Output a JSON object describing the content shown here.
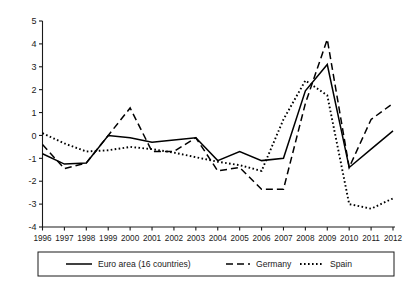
{
  "chart_data": {
    "type": "line",
    "title": "",
    "subtitle": "",
    "xlabel": "",
    "ylabel": "",
    "x": [
      1996,
      1997,
      1998,
      1999,
      2000,
      2001,
      2002,
      2003,
      2004,
      2005,
      2006,
      2007,
      2008,
      2009,
      2010,
      2011,
      2012
    ],
    "categories": [
      "1996",
      "1997",
      "1998",
      "1999",
      "2000",
      "2001",
      "2002",
      "2003",
      "2004",
      "2005",
      "2006",
      "2007",
      "2008",
      "2009",
      "2010",
      "2011",
      "2012"
    ],
    "xlim": [
      1996,
      2012
    ],
    "ylim": [
      -4,
      5
    ],
    "yticks": [
      5,
      4,
      3,
      2,
      1,
      0,
      -1,
      -2,
      -3,
      -4
    ],
    "ytick_labels": [
      "5",
      "4",
      "3",
      "2",
      "1",
      "0",
      "-1",
      "-2",
      "-3",
      "-4"
    ],
    "grid": false,
    "legend_position": "bottom",
    "series": [
      {
        "name": "Euro area (16 countries)",
        "style": "solid",
        "color": "#000000",
        "values": [
          -0.8,
          -1.25,
          -1.2,
          0.0,
          -0.1,
          -0.3,
          -0.2,
          -0.1,
          -1.1,
          -0.7,
          -1.1,
          -1.0,
          1.95,
          3.1,
          -1.4,
          -0.6,
          0.2
        ]
      },
      {
        "name": "Germany",
        "style": "dashed",
        "color": "#000000",
        "values": [
          -0.4,
          -1.45,
          -1.2,
          0.0,
          1.2,
          -0.7,
          -0.7,
          -0.1,
          -1.55,
          -1.4,
          -2.35,
          -2.35,
          1.4,
          4.2,
          -1.4,
          0.7,
          1.4
        ]
      },
      {
        "name": "Spain",
        "style": "dotted",
        "color": "#000000",
        "values": [
          0.1,
          -0.35,
          -0.7,
          -0.65,
          -0.5,
          -0.6,
          -0.75,
          -0.95,
          -1.15,
          -1.3,
          -1.55,
          0.7,
          2.4,
          1.75,
          -3.0,
          -3.2,
          -2.75
        ]
      }
    ]
  },
  "axes": {
    "y_tick_labels": [
      "5",
      "4",
      "3",
      "2",
      "1",
      "0",
      "-1",
      "-2",
      "-3",
      "-4"
    ],
    "x_tick_labels": [
      "1996",
      "1997",
      "1998",
      "1999",
      "2000",
      "2001",
      "2002",
      "2003",
      "2004",
      "2005",
      "2006",
      "2007",
      "2008",
      "2009",
      "2010",
      "2011",
      "2012"
    ]
  },
  "legend": {
    "items": [
      {
        "label": "Euro area (16 countries)",
        "style": "solid"
      },
      {
        "label": "Germany",
        "style": "dashed"
      },
      {
        "label": "Spain",
        "style": "dotted"
      }
    ]
  }
}
